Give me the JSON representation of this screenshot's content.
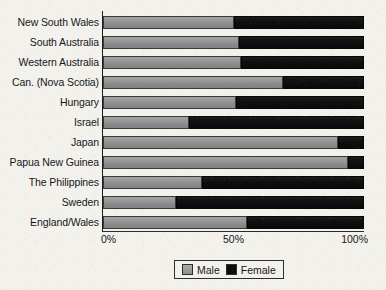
{
  "chart_data": {
    "type": "bar",
    "orientation": "horizontal",
    "stacked": true,
    "normalized": "100%",
    "title": "",
    "xlabel": "",
    "ylabel": "",
    "xlim": [
      0,
      100
    ],
    "grid": false,
    "legend_position": "bottom-center",
    "categories": [
      "New South Wales",
      "South Australia",
      "Western Australia",
      "Can. (Nova Scotia)",
      "Hungary",
      "Israel",
      "Japan",
      "Papua New Guinea",
      "The Philippines",
      "Sweden",
      "England/Wales"
    ],
    "series": [
      {
        "name": "Male",
        "color": "#8e8e8e",
        "values": [
          50,
          52,
          53,
          69,
          51,
          33,
          90,
          94,
          38,
          28,
          55
        ]
      },
      {
        "name": "Female",
        "color": "#111111",
        "values": [
          50,
          48,
          47,
          31,
          49,
          67,
          10,
          6,
          62,
          72,
          45
        ]
      }
    ],
    "xticks": [
      {
        "value": 0,
        "label": "0%"
      },
      {
        "value": 50,
        "label": "50%"
      },
      {
        "value": 100,
        "label": "100%"
      }
    ]
  },
  "legend": {
    "items": [
      {
        "label": "Male",
        "swatch": "male-swatch-icon"
      },
      {
        "label": "Female",
        "swatch": "female-swatch-icon"
      }
    ]
  }
}
